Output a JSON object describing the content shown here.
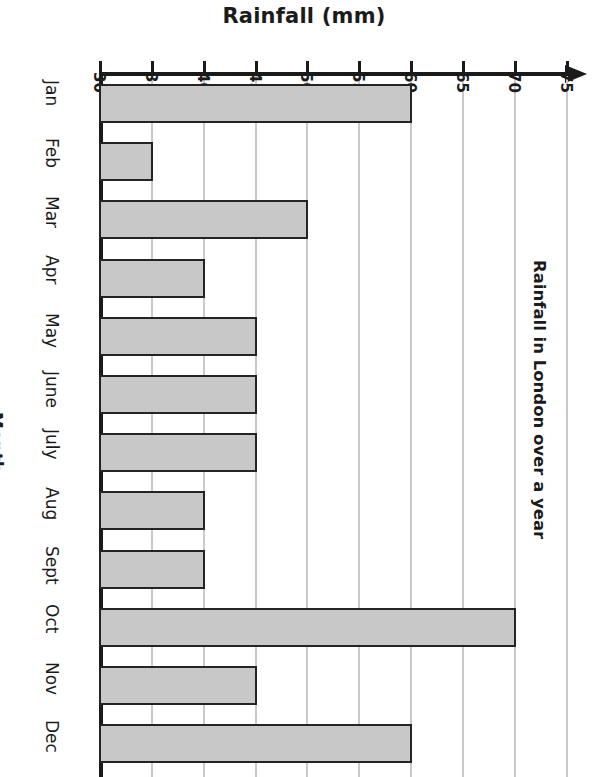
{
  "chart_data": {
    "type": "bar",
    "orientation": "horizontal",
    "title": "Rainfall in London over a year",
    "xlabel": "Rainfall (mm)",
    "ylabel": "Month",
    "categories": [
      "Jan",
      "Feb",
      "Mar",
      "Apr",
      "May",
      "June",
      "July",
      "Aug",
      "Sept",
      "Oct",
      "Nov",
      "Dec"
    ],
    "values": [
      60,
      35,
      50,
      40,
      45,
      45,
      45,
      40,
      40,
      70,
      45,
      60
    ],
    "xlim": [
      30,
      75
    ],
    "xticks": [
      30,
      35,
      40,
      45,
      50,
      55,
      60,
      65,
      70,
      75
    ],
    "xtick_labels": [
      "30",
      "35",
      "40",
      "45",
      "50",
      "55",
      "60",
      "65",
      "70",
      "75"
    ],
    "grid": true,
    "legend": false,
    "bar_fill_color": "#c8c8c8",
    "bar_edge_color": "#242424",
    "gridline_color": "#c9c9c9",
    "axis_color": "#1a1a1a"
  },
  "axis": {
    "top_label": "Rainfall (mm)",
    "left_label": "Month",
    "right_title": "Rainfall in London over a year"
  }
}
